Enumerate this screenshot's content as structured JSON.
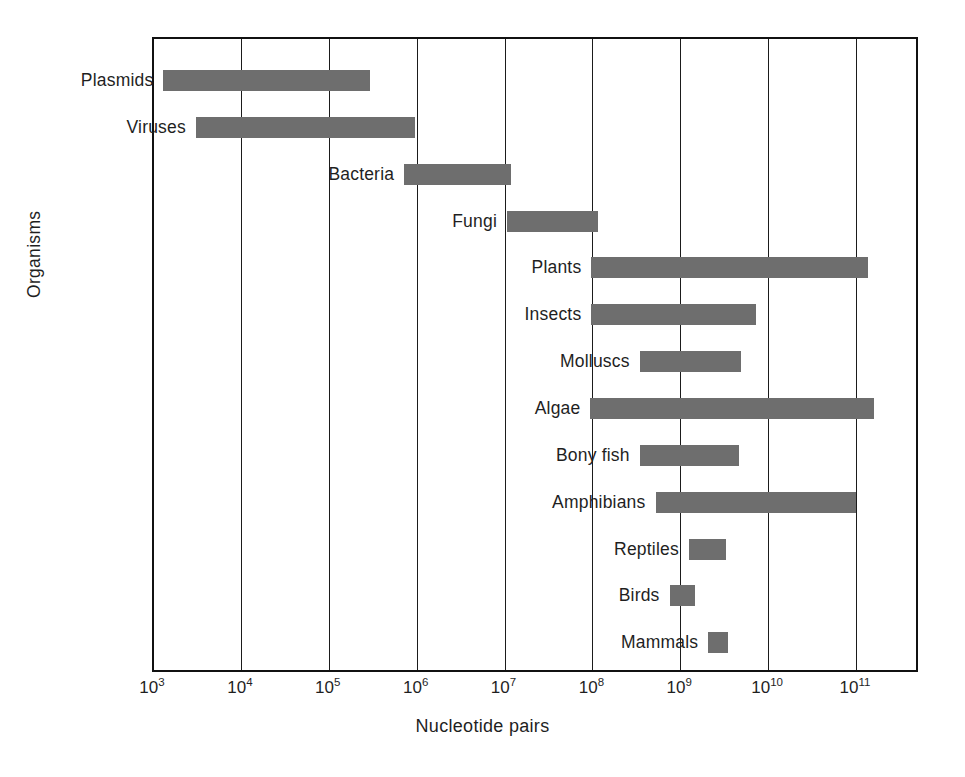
{
  "chart_data": {
    "type": "bar",
    "orientation": "horizontal",
    "title": "",
    "xlabel": "Nucleotide pairs",
    "ylabel": "Organisms",
    "xscale": "log",
    "xlim": [
      1000,
      1000000000000
    ],
    "xticks": [
      1000,
      10000,
      100000,
      1000000,
      10000000,
      100000000,
      1000000000,
      10000000000,
      100000000000
    ],
    "xtick_labels": [
      "10^3",
      "10^4",
      "10^5",
      "10^6",
      "10^7",
      "10^8",
      "10^9",
      "10^10",
      "10^11"
    ],
    "xtick_mantissa": [
      "10",
      "10",
      "10",
      "10",
      "10",
      "10",
      "10",
      "10",
      "10"
    ],
    "xtick_exponents": [
      "3",
      "4",
      "5",
      "6",
      "7",
      "8",
      "9",
      "10",
      "11"
    ],
    "grid": true,
    "grid_axis": "x",
    "legend": false,
    "bar_color": "#6e6e6e",
    "categories": [
      "Plasmids",
      "Viruses",
      "Bacteria",
      "Fungi",
      "Plants",
      "Insects",
      "Molluscs",
      "Algae",
      "Bony fish",
      "Amphibians",
      "Reptiles",
      "Birds",
      "Mammals"
    ],
    "ranges": [
      {
        "label": "Plasmids",
        "low_exp": 3.13,
        "high_exp": 5.48
      },
      {
        "label": "Viruses",
        "low_exp": 3.5,
        "high_exp": 5.99
      },
      {
        "label": "Bacteria",
        "low_exp": 5.87,
        "high_exp": 7.08
      },
      {
        "label": "Fungi",
        "low_exp": 7.04,
        "high_exp": 8.07
      },
      {
        "label": "Plants",
        "low_exp": 8.0,
        "high_exp": 11.15
      },
      {
        "label": "Insects",
        "low_exp": 8.0,
        "high_exp": 9.87
      },
      {
        "label": "Molluscs",
        "low_exp": 8.55,
        "high_exp": 9.7
      },
      {
        "label": "Algae",
        "low_exp": 7.99,
        "high_exp": 11.22
      },
      {
        "label": "Bony fish",
        "low_exp": 8.55,
        "high_exp": 9.68
      },
      {
        "label": "Amphibians",
        "low_exp": 8.73,
        "high_exp": 11.01
      },
      {
        "label": "Reptiles",
        "low_exp": 9.11,
        "high_exp": 9.53
      },
      {
        "label": "Birds",
        "low_exp": 8.89,
        "high_exp": 9.18
      },
      {
        "label": "Mammals",
        "low_exp": 9.33,
        "high_exp": 9.55
      }
    ]
  },
  "axes": {
    "x_title": "Nucleotide pairs",
    "y_title": "Organisms"
  }
}
